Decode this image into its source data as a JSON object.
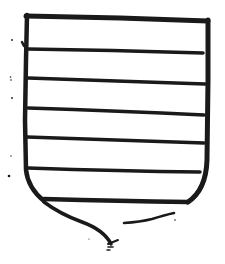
{
  "figure": {
    "ink_color": "#1a1a1a",
    "background": "#ffffff",
    "bar_count": 6
  }
}
